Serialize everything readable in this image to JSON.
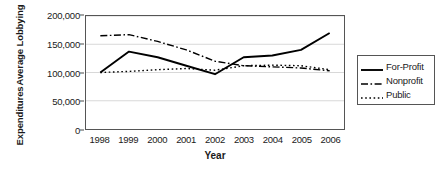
{
  "chart_data": {
    "type": "line",
    "title": "",
    "xlabel": "Year",
    "ylabel_line1": "Average Lobbying",
    "ylabel_line2": "Expenditures",
    "categories": [
      "1998",
      "1999",
      "2000",
      "2001",
      "2002",
      "2003",
      "2004",
      "2005",
      "2006"
    ],
    "ylim": [
      0,
      200000
    ],
    "yticks": [
      0,
      50000,
      100000,
      150000,
      200000
    ],
    "ytick_labels": [
      "0",
      "50,000",
      "100,000",
      "150,000",
      "200,000"
    ],
    "grid": "horizontal",
    "legend_position": "right-outside",
    "series": [
      {
        "name": "For-Profit",
        "style": "solid",
        "color": "#000000",
        "values": [
          100000,
          137000,
          127000,
          112000,
          97000,
          127000,
          130000,
          140000,
          170000
        ]
      },
      {
        "name": "Nonprofit",
        "style": "dash-dot",
        "color": "#000000",
        "values": [
          165000,
          167000,
          155000,
          140000,
          120000,
          112000,
          110000,
          108000,
          103000
        ]
      },
      {
        "name": "Public",
        "style": "dotted",
        "color": "#000000",
        "values": [
          100000,
          102000,
          105000,
          107000,
          104000,
          112000,
          113000,
          112000,
          105000
        ]
      }
    ]
  },
  "legend": {
    "items": [
      {
        "label": "For-Profit"
      },
      {
        "label": "Nonprofit"
      },
      {
        "label": "Public"
      }
    ]
  }
}
